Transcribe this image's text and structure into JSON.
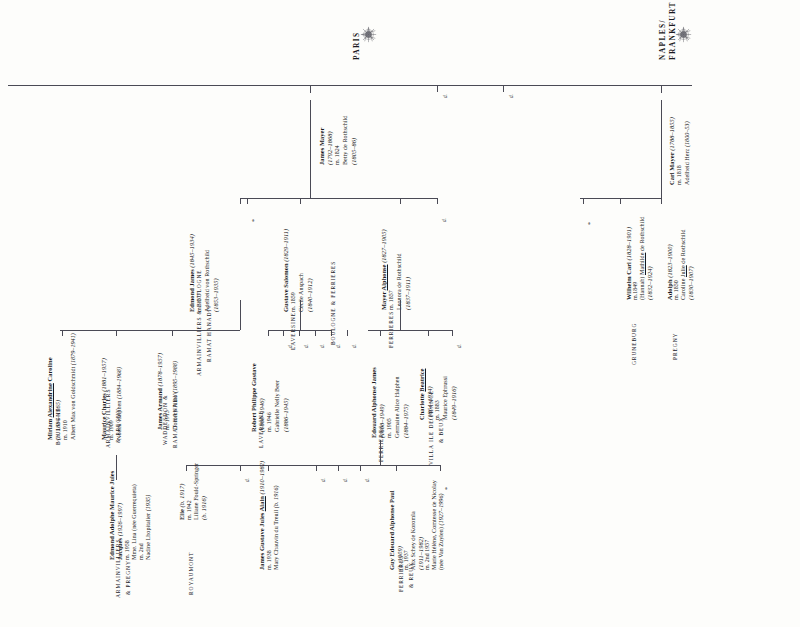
{
  "document": {
    "title": "Rothschild Family Tree — Paris and Naples/Frankfurt Branches",
    "orientation": "rotated-90-ccw"
  },
  "branches": [
    {
      "id": "paris",
      "label": "PARIS",
      "crest": "rothschild-crest-icon"
    },
    {
      "id": "naples",
      "label": "NAPLES/\nFRANKFURT",
      "crest": "rothschild-crest-icon",
      "label_line1": "NAPLES/",
      "label_line2": "FRANKFURT"
    }
  ],
  "people": [
    {
      "id": "carl-mayer",
      "name": "Carl Mayer",
      "dates": "(1788–1855)",
      "marriage": "m. 1818",
      "spouse": "Adelheid Herz",
      "spouse_dates": "(1800–53)",
      "estate": ""
    },
    {
      "id": "james-mayer",
      "name": "James Mayer",
      "dates": "(1792–1868)",
      "marriage": "m. 1824",
      "spouse": "Betty de Rothschild",
      "spouse_dates": "(1805–86)",
      "estate": "BOULOGNE & FERRIERES"
    },
    {
      "id": "adolph",
      "name": "Adolph",
      "dates": "(1823–1900)",
      "marriage": "m. 1850",
      "spouse": "Caroline Julie de Rothschild",
      "spouse_underline": "Julie",
      "spouse_dates": "(1830–1907)",
      "estate": "PREGNY"
    },
    {
      "id": "wilhelm-carl",
      "name": "Wilhelm Carl",
      "dates": "(1828–1901)",
      "marriage": "m.1849",
      "spouse": "(Hannah) Mathilde de Rothschild",
      "spouse_underline": "Mathilde",
      "spouse_dates": "(1832–1924)",
      "estate": "GRUNEBURG"
    },
    {
      "id": "edmond-james",
      "name": "Edmond James",
      "dates": "(1845–1934)",
      "marriage": "m. 1877",
      "spouse": "Adelheid von Rothschild",
      "spouse_dates": "(1853–1935)",
      "estate_line1": "ARMAINVILLIERS & BOULOGNE",
      "estate_line2": "RAMAT HANADIV"
    },
    {
      "id": "gustave-salomon",
      "name": "Gustave Salomon",
      "dates": "(1829–1911)",
      "marriage": "m. 1859",
      "spouse": "Cécile Anspach",
      "spouse_dates": "(1840–1912)",
      "estate": "LAVERSINE"
    },
    {
      "id": "mayer-alphonse",
      "name": "Mayer Alphonse",
      "name_underline": "Alphonse",
      "dates": "(1827–1905)",
      "marriage": "m. 1857",
      "spouse": "Leonora de Rothschild",
      "spouse_dates": "(1837–1911)",
      "estate": "FERRIERES"
    },
    {
      "id": "miriam-alexandrine",
      "name": "Miriam Alexandrine Caroline",
      "name_underline": "Alexandrine",
      "dates": "(b. 1884–1965)",
      "marriage": "m. 1910",
      "spouse": "Albert Max von Goldschmidt",
      "spouse_dates": "(1879–1941)",
      "estate": "BOULOGNE"
    },
    {
      "id": "maurice-charles",
      "name": "Maurice Charles",
      "dates": "(1881–1957)",
      "marriage": "m. 1909",
      "spouse": "Noemi Halphen",
      "spouse_dates": "(1884–1968)",
      "estate_line1": "ARMAINVILLIERS",
      "estate_line2": "& PREGNY"
    },
    {
      "id": "james-armand",
      "name": "James Armand",
      "dates": "(1878–1957)",
      "marriage": "m. 1913",
      "spouse": "Dorothy Pinto",
      "spouse_dates": "(1895–1988)",
      "estate_line1": "WADDESDON &",
      "estate_line2": "RAMAT HANADIV"
    },
    {
      "id": "robert-philippe",
      "name": "Robert Philippe Gustave",
      "dates": "(1880–1946)",
      "marriage": "m. 1946",
      "spouse": "Gabrielle Nelly Beer",
      "spouse_dates": "(1886–1945)",
      "estate": "LAVERSINE"
    },
    {
      "id": "charlotte-beatrice",
      "name": "Charlotte Beatrice",
      "name_underline": "Beatrice",
      "dates": "(1864–1934)",
      "marriage": "m. 1883",
      "spouse": "Maurice Ephrussi",
      "spouse_dates": "(1849–1916)",
      "estate_line1": "VILLA ILE DE FRANCE",
      "estate_line2": "& BEUX"
    },
    {
      "id": "edouard-alphonse",
      "name": "Edouard Alphonse James",
      "dates": "(1868–1949)",
      "marriage": "m. 1905",
      "spouse": "Germaine Alice Halphen",
      "spouse_dates": "(1884–1975)",
      "estate": "FERRIERES"
    },
    {
      "id": "edmond-adolphe",
      "name": "Edmond Adolphe Maurice Jules Jacques",
      "dates": "(1926–1997)",
      "marriage": "m. 1958",
      "spouse": "Mme. Lina (née Guerrequieta)",
      "marriage2": "m. 2nd",
      "spouse2": "Nadine Lhopitalier",
      "spouse2_dates": "(1935)",
      "estate_line1": "ARMAINVILLIERS",
      "estate_line2": "& PREGNY"
    },
    {
      "id": "elie",
      "name": "Elie",
      "dates": "(b. 1917)",
      "marriage": "m. 1942",
      "spouse": "Liliane Fould-Springer",
      "spouse_dates": "(b. 1916)",
      "estate": "ROYAUMONT"
    },
    {
      "id": "james-gustave-alain",
      "name": "James Gustave Jules Alain",
      "name_underline": "Alain",
      "dates": "(1910–1982)",
      "marriage": "m. 1938",
      "spouse": "Mary Chauvin du Treuil",
      "spouse_dates": "(b. 1916)",
      "estate": ""
    },
    {
      "id": "guy-edouard",
      "name": "Guy Edouard Alphonse Paul",
      "dates": "(b. 1909)",
      "marriage": "m. 1937",
      "spouse": "Alix Schey de Koromla",
      "spouse_dates": "(1911–1982)",
      "marriage2": "m. 2nd 1957",
      "spouse2": "Marie Hélène, Comtesse de Nicolay",
      "spouse2_note": "(née Van Zuylen)",
      "spouse2_dates": "(1927–1996)",
      "estate_line1": "FERRIERES",
      "estate_line2": "& REUX"
    }
  ],
  "stubs": {
    "d_label": "d.",
    "asterisk": "*"
  }
}
